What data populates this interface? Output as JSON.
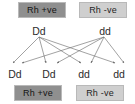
{
  "diagram": {
    "line_color": "#6f6f6f",
    "accent_dark": "#8f8f8f",
    "accent_light": "#cfcfcf",
    "parents": {
      "phenotypes": [
        {
          "label": "Rh +ve",
          "shade": "dark"
        },
        {
          "label": "Rh -ve",
          "shade": "light"
        }
      ],
      "genotypes": [
        {
          "label": "Dd"
        },
        {
          "label": "dd"
        }
      ]
    },
    "offspring": {
      "genotypes": [
        {
          "label": "Dd"
        },
        {
          "label": "Dd"
        },
        {
          "label": "dd"
        },
        {
          "label": "dd"
        }
      ],
      "phenotypes": [
        {
          "label": "Rh +ve",
          "shade": "dark"
        },
        {
          "label": "Rh -ve",
          "shade": "light"
        }
      ]
    }
  }
}
